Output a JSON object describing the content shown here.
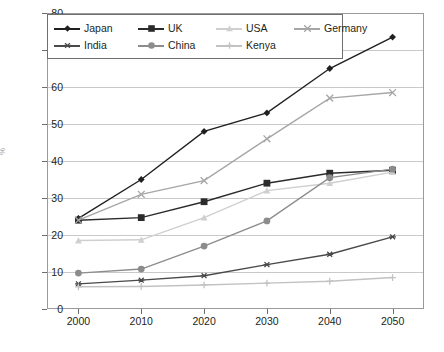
{
  "chart_data": {
    "type": "line",
    "title": "",
    "xlabel": "",
    "ylabel": "%",
    "x": [
      2000,
      2010,
      2020,
      2030,
      2040,
      2050
    ],
    "categories": [
      "2000",
      "2010",
      "2020",
      "2030",
      "2040",
      "2050"
    ],
    "xlim": [
      1995,
      2055
    ],
    "ylim": [
      0,
      80
    ],
    "yticks": [
      0,
      10,
      20,
      30,
      40,
      50,
      60,
      70,
      80
    ],
    "ytick_labels": [
      "0",
      "10",
      "20",
      "30",
      "40",
      "50",
      "60",
      "70",
      "80"
    ],
    "grid": true,
    "legend_position": "top-left",
    "series": [
      {
        "name": "Japan",
        "marker": "diamond",
        "color": "#221f1f",
        "values": [
          24.5,
          35.0,
          48.0,
          53.0,
          65.0,
          73.5
        ]
      },
      {
        "name": "UK",
        "marker": "square",
        "color": "#2b2b2b",
        "values": [
          24.0,
          24.7,
          29.0,
          34.0,
          36.7,
          37.5
        ]
      },
      {
        "name": "USA",
        "marker": "triangle",
        "color": "#cfcfcf",
        "values": [
          18.5,
          18.7,
          24.7,
          32.0,
          34.0,
          37.0
        ]
      },
      {
        "name": "Germany",
        "marker": "x",
        "color": "#a6a6a6",
        "values": [
          24.0,
          31.0,
          34.7,
          46.0,
          57.0,
          58.5
        ]
      },
      {
        "name": "India",
        "marker": "asterisk",
        "color": "#4a4a4a",
        "values": [
          6.8,
          7.8,
          9.0,
          12.0,
          14.8,
          19.5
        ]
      },
      {
        "name": "China",
        "marker": "circle",
        "color": "#8c8c8c",
        "values": [
          9.7,
          10.8,
          17.0,
          23.8,
          35.5,
          37.8
        ]
      },
      {
        "name": "Kenya",
        "marker": "plus",
        "color": "#c2c2c2",
        "values": [
          6.0,
          6.1,
          6.5,
          7.0,
          7.5,
          8.5
        ]
      }
    ]
  },
  "legend": {
    "items": [
      {
        "label": "Japan"
      },
      {
        "label": "UK"
      },
      {
        "label": "USA"
      },
      {
        "label": "Germany"
      },
      {
        "label": "India"
      },
      {
        "label": "China"
      },
      {
        "label": "Kenya"
      }
    ]
  }
}
